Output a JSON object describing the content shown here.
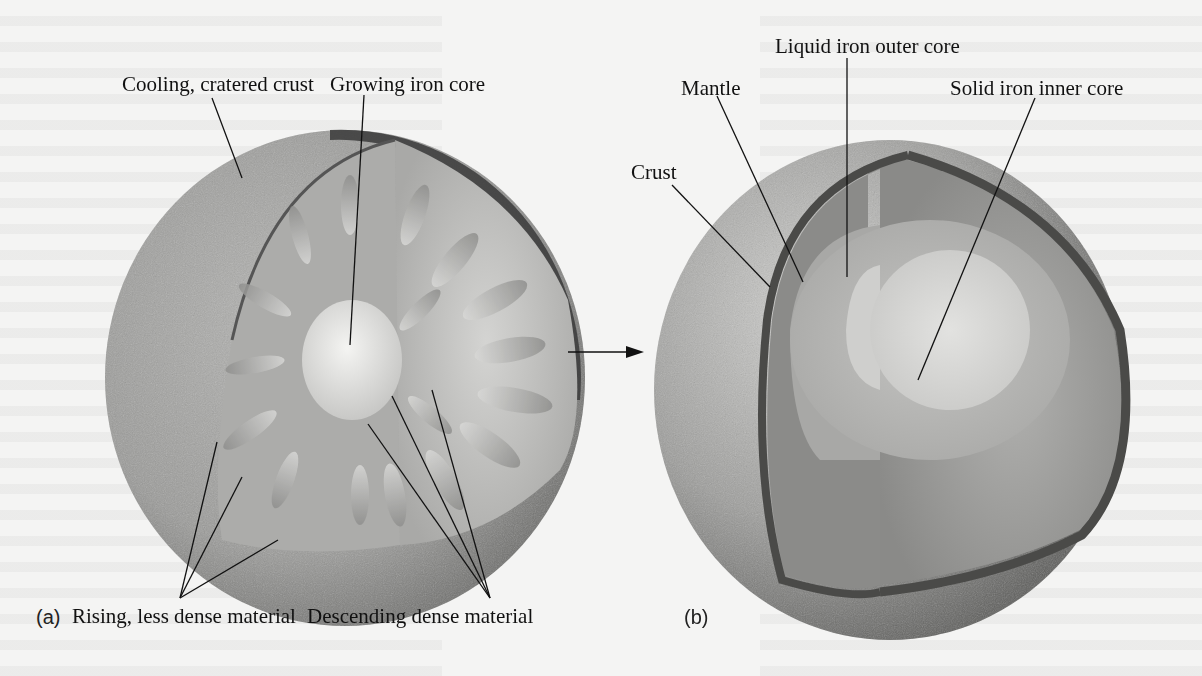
{
  "figure": {
    "panel_a": {
      "panel_label": "(a)",
      "labels": {
        "crust": "Cooling, cratered crust",
        "core": "Growing iron core",
        "rising": "Rising, less dense material",
        "descending": "Descending dense material"
      }
    },
    "panel_b": {
      "panel_label": "(b)",
      "labels": {
        "outer_core": "Liquid iron outer core",
        "mantle": "Mantle",
        "inner_core": "Solid iron inner core",
        "crust": "Crust"
      }
    },
    "arrow": "arrow-right"
  }
}
